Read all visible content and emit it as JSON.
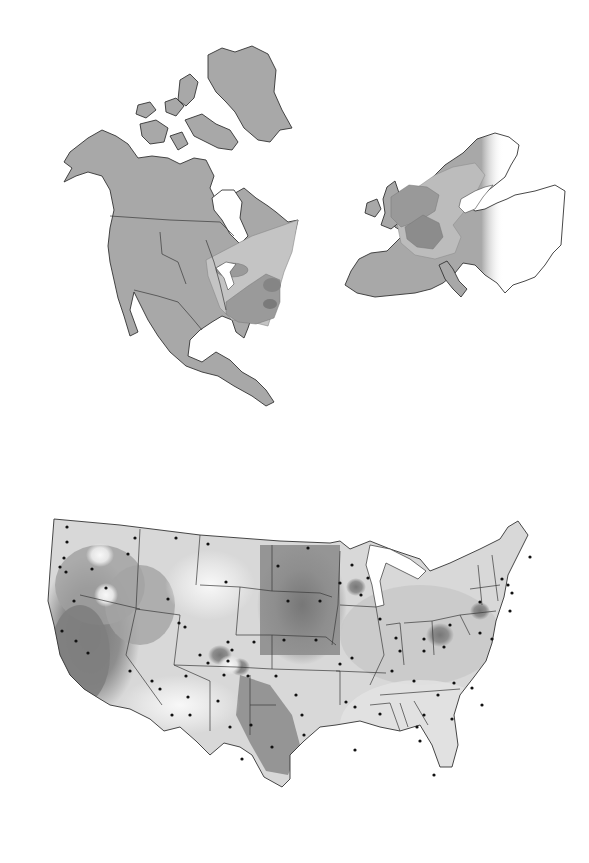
{
  "page": {
    "background": "#ffffff",
    "maps": [
      {
        "id": "north-america",
        "description": "North America and Greenland with nested shaded regions over the eastern United States and southeastern Canada",
        "land_color": "#a8a8a8",
        "zones": [
          {
            "level": 1,
            "color": "#c4c4c4",
            "area": "northeastern US / southeastern Canada wedge"
          },
          {
            "level": 2,
            "color": "#9a9a9a",
            "area": "Great Lakes / Ohio Valley"
          },
          {
            "level": 3,
            "color": "#8a8a8a",
            "area": "Pennsylvania / Virginia core"
          },
          {
            "level": 4,
            "color": "#7a7a7a",
            "area": "Chesapeake area"
          }
        ]
      },
      {
        "id": "europe",
        "description": "Europe with nested shaded regions over the British Isles, northern France, Benelux, Germany and southern Scandinavia; eastern edge fades to white",
        "land_color": "#a8a8a8",
        "zones": [
          {
            "level": 1,
            "color": "#bcbcbc",
            "area": "southern Scandinavia / Baltic to Alps band"
          },
          {
            "level": 2,
            "color": "#999999",
            "area": "British Isles / North Sea / Germany"
          },
          {
            "level": 3,
            "color": "#8c8c8c",
            "area": "northern France / Benelux / western Germany"
          }
        ]
      },
      {
        "id": "contiguous-us",
        "description": "Contiguous United States with state borders, station dots and a grayscale contour surface (darker = higher values)",
        "shades": [
          "#f2f2f2",
          "#dedede",
          "#c8c8c8",
          "#aaaaaa",
          "#8e8e8e",
          "#777777"
        ],
        "station_marker": "dot"
      }
    ]
  }
}
